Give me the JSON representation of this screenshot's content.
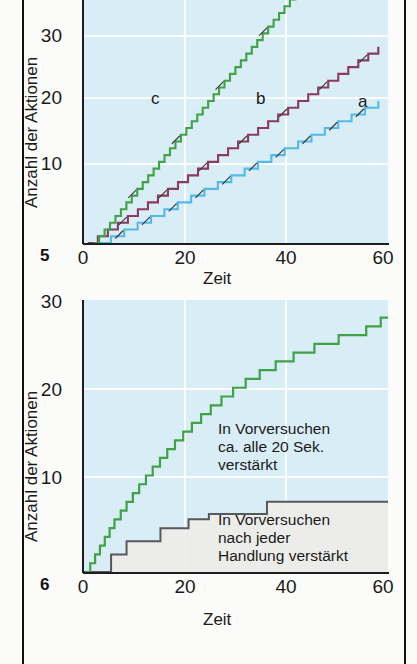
{
  "figures": [
    {
      "number": "5",
      "axis": {
        "ylabel": "Anzahl der Aktionen",
        "xlabel": "Zeit",
        "xticks": [
          "0",
          "20",
          "40",
          "60"
        ],
        "yticks": [
          "10",
          "20",
          "30"
        ]
      },
      "curve_labels": [
        {
          "text": "a"
        },
        {
          "text": "b"
        },
        {
          "text": "c"
        }
      ]
    },
    {
      "number": "6",
      "axis": {
        "ylabel": "Anzahl der Aktionen",
        "xlabel": "Zeit",
        "xticks": [
          "0",
          "20",
          "40",
          "60"
        ],
        "yticks": [
          "10",
          "20",
          "30"
        ]
      },
      "notes": [
        {
          "text": "In Vorversuchen\nca. alle 20 Sek.\nverstärkt"
        },
        {
          "text": "In Vorversuchen\nnach jeder\nHandlung verstärkt"
        }
      ]
    }
  ],
  "colors": {
    "plot_background": "#d8edf5",
    "gridline": "#ffffff",
    "green": "#3fa246",
    "purple": "#8c3a5f",
    "blue": "#54b9e8",
    "gray": "#55595a",
    "gray_fill": "#ededea",
    "axis": "#1d1d1d",
    "page": "#fbfbf9"
  },
  "chart_data": [
    {
      "type": "line",
      "title": "",
      "subtitle": "",
      "xlabel": "Zeit",
      "ylabel": "Anzahl der Aktionen",
      "xlim": [
        0,
        63
      ],
      "ylim": [
        0,
        38
      ],
      "xticks": [
        0,
        20,
        40,
        60
      ],
      "yticks": [
        10,
        20,
        30
      ],
      "grid": true,
      "legend_position": "inline-annotation",
      "note": "Kumulative Aufzeichnungen (cumulative records) mit Verstärkungsmarkierungen als schräge Striche auf der Kurve",
      "series": [
        {
          "name": "a",
          "label": "a",
          "color": "#54b9e8",
          "step_interval": 2.55,
          "start_x": 3.0,
          "end_x": 61.0,
          "end_y": 21,
          "hatch_every": 2,
          "label_at": {
            "x": 57.0,
            "y": 21.8
          }
        },
        {
          "name": "b",
          "label": "b",
          "color": "#8c3a5f",
          "step_interval": 2.05,
          "start_x": 1.0,
          "end_x": 61.0,
          "end_y": 28.5,
          "hatch_every": 4,
          "label_at": {
            "x": 35.0,
            "y": 21.8
          }
        },
        {
          "name": "c",
          "label": "c",
          "color": "#3fa246",
          "step_interval": 1.2,
          "start_x": 2.2,
          "end_x": 45.0,
          "end_y": 37.5,
          "hatch_every": 8,
          "label_at": {
            "x": 14.0,
            "y": 21.8
          }
        }
      ]
    },
    {
      "type": "line",
      "title": "",
      "subtitle": "",
      "xlabel": "Zeit",
      "ylabel": "Anzahl der Aktionen",
      "xlim": [
        0,
        63
      ],
      "ylim": [
        0,
        31
      ],
      "xticks": [
        0,
        20,
        40,
        60
      ],
      "yticks": [
        10,
        20,
        30
      ],
      "grid": true,
      "legend_position": "inline-annotation",
      "series": [
        {
          "name": "ca-alle-20-sek",
          "label": "In Vorversuchen ca. alle 20 Sek. verstärkt",
          "color": "#3fa246",
          "shape": "ogive",
          "points_x": [
            0.5,
            1.5,
            2.5,
            3.5,
            4.5,
            5.5,
            6.5,
            7.8,
            9.0,
            10.3,
            11.6,
            13.0,
            14.4,
            15.9,
            17.4,
            19.0,
            20.7,
            22.5,
            24.4,
            26.4,
            28.6,
            31.0,
            33.6,
            36.5,
            39.8,
            43.5,
            47.8,
            52.8,
            58.5,
            61.5
          ],
          "points_y": [
            0,
            1,
            2,
            3,
            4,
            5,
            6,
            7,
            8,
            9,
            10,
            11,
            12,
            13,
            14,
            15,
            16,
            17,
            18,
            19,
            20,
            21,
            22,
            23,
            24,
            25,
            26,
            27,
            28,
            29
          ]
        },
        {
          "name": "nach-jeder-handlung",
          "label": "In Vorversuchen nach jeder Handlung verstärkt",
          "color": "#55595a",
          "fill": "#ededea",
          "shape": "step",
          "points_x": [
            4.0,
            5.8,
            9.0,
            16.0,
            21.8,
            26.0,
            38.0,
            61.5
          ],
          "points_y": [
            0,
            2,
            3.5,
            5,
            6,
            6.6,
            8,
            8
          ]
        }
      ]
    }
  ]
}
